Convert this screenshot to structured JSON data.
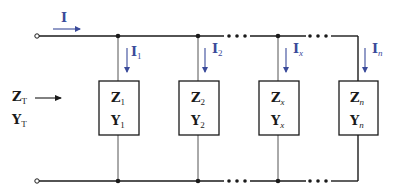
{
  "diagram": {
    "colors": {
      "wire": "#1a1a1a",
      "branch_wire": "#555555",
      "current_arrow": "#3a4a9a",
      "text": "#1a1a1a"
    },
    "source_current": {
      "symbol": "I",
      "subscript": ""
    },
    "total": {
      "impedance": {
        "symbol": "Z",
        "subscript": "T"
      },
      "admittance": {
        "symbol": "Y",
        "subscript": "T"
      }
    },
    "branches": [
      {
        "current": {
          "symbol": "I",
          "subscript": "1"
        },
        "impedance": {
          "symbol": "Z",
          "subscript": "1"
        },
        "admittance": {
          "symbol": "Y",
          "subscript": "1"
        }
      },
      {
        "current": {
          "symbol": "I",
          "subscript": "2"
        },
        "impedance": {
          "symbol": "Z",
          "subscript": "2"
        },
        "admittance": {
          "symbol": "Y",
          "subscript": "2"
        }
      },
      {
        "current": {
          "symbol": "I",
          "subscript": "x"
        },
        "impedance": {
          "symbol": "Z",
          "subscript": "x"
        },
        "admittance": {
          "symbol": "Y",
          "subscript": "x"
        }
      },
      {
        "current": {
          "symbol": "I",
          "subscript": "n"
        },
        "impedance": {
          "symbol": "Z",
          "subscript": "n"
        },
        "admittance": {
          "symbol": "Y",
          "subscript": "n"
        }
      }
    ],
    "ellipsis": "• • •"
  }
}
